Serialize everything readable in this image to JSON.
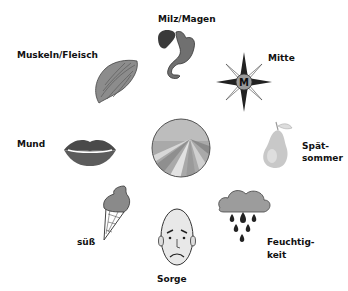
{
  "diagram": {
    "type": "circular-association",
    "center": {
      "icon": "field-landscape-icon"
    },
    "items": [
      {
        "label": "Milz/Magen",
        "icon": "spleen-stomach-icon"
      },
      {
        "label": "Mitte",
        "icon": "compass-rose-icon",
        "icon_letter": "M"
      },
      {
        "label_line1": "Spät-",
        "label_line2": "sommer",
        "icon": "pear-icon"
      },
      {
        "label_line1": "Feuchtig-",
        "label_line2": "keit",
        "icon": "rain-cloud-icon"
      },
      {
        "label": "Sorge",
        "icon": "worried-face-icon"
      },
      {
        "label": "süß",
        "icon": "ice-cream-cone-icon"
      },
      {
        "label": "Mund",
        "icon": "lips-icon"
      },
      {
        "label": "Muskeln/Fleisch",
        "icon": "muscle-icon"
      }
    ]
  }
}
